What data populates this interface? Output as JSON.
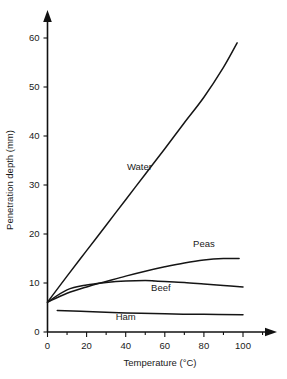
{
  "chart_data": {
    "type": "line",
    "title": "",
    "xlabel": "Temperature (°C)",
    "ylabel": "Penetration depth (mm)",
    "xlim": [
      0,
      115
    ],
    "ylim": [
      0,
      64
    ],
    "xticks": [
      0,
      20,
      40,
      60,
      80,
      100
    ],
    "xtick_labels": [
      "0",
      "20",
      "40",
      "60",
      "80",
      "100"
    ],
    "yticks": [
      0,
      10,
      20,
      30,
      40,
      50,
      60
    ],
    "ytick_labels": [
      "0",
      "10",
      "20",
      "30",
      "40",
      "50",
      "60"
    ],
    "grid": false,
    "legend": "inline-labels",
    "series": [
      {
        "name": "Water",
        "label": "Water",
        "label_x": 47,
        "label_y": 33,
        "x": [
          0,
          10,
          20,
          30,
          40,
          50,
          60,
          70,
          80,
          90,
          97
        ],
        "y": [
          6.1,
          11.4,
          16.6,
          21.8,
          27.0,
          32.2,
          37.4,
          42.7,
          47.9,
          54.0,
          59.0
        ]
      },
      {
        "name": "Peas",
        "label": "Peas",
        "label_x": 80,
        "label_y": 17.3,
        "x": [
          0,
          10,
          20,
          30,
          40,
          50,
          60,
          70,
          80,
          90,
          98
        ],
        "y": [
          6.1,
          7.9,
          9.2,
          10.3,
          11.4,
          12.4,
          13.3,
          14.1,
          14.7,
          15.0,
          15.0
        ]
      },
      {
        "name": "Beef",
        "label": "Beef",
        "label_x": 58,
        "label_y": 8.4,
        "x": [
          0,
          10,
          20,
          30,
          40,
          50,
          55,
          60,
          70,
          80,
          90,
          100
        ],
        "y": [
          6.1,
          8.6,
          9.6,
          10.1,
          10.4,
          10.5,
          10.4,
          10.3,
          10.1,
          9.8,
          9.5,
          9.2
        ]
      },
      {
        "name": "Ham",
        "label": "Ham",
        "label_x": 40,
        "label_y": 2.4,
        "x": [
          5,
          20,
          40,
          60,
          80,
          100
        ],
        "y": [
          4.4,
          4.2,
          3.9,
          3.7,
          3.6,
          3.5
        ]
      }
    ]
  }
}
